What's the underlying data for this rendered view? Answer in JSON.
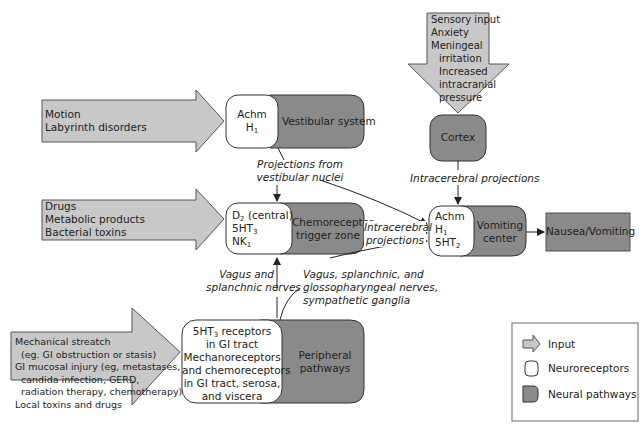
{
  "diagram": {
    "type": "flowchart"
  },
  "inputs": {
    "motion": {
      "line1": "Motion",
      "line2": "Labyrinth disorders"
    },
    "drugs": {
      "line1": "Drugs",
      "line2": "Metabolic products",
      "line3": "Bacterial toxins"
    },
    "sensory": {
      "line1": "Sensory input",
      "line2": "Anxiety",
      "line3": "Meningeal",
      "line4": "irritation",
      "line5": "Increased",
      "line6": "intracranial",
      "line7": "pressure"
    },
    "gi": {
      "line1": "Mechanical streatch",
      "line2": "(eg. GI obstruction or stasis)",
      "line3": "GI mucosal injury (eg, metastases,",
      "line4": "candida infection, GERD,",
      "line5": "radiation therapy, chemotherapy)",
      "line6": "Local toxins and drugs"
    }
  },
  "nodes": {
    "vestibular": {
      "receptors_line1": "Achm",
      "receptors_line2": "H",
      "receptors_line2_sub": "1",
      "label": "Vestibular system"
    },
    "ctz": {
      "r1": "D",
      "r1_sub": "2",
      "r1_suffix": " (central)",
      "r2": "5HT",
      "r2_sub": "3",
      "r3": "NK",
      "r3_sub": "1",
      "label_line1": "Chemoreceptor",
      "label_line2": "trigger zone"
    },
    "cortex": {
      "label": "Cortex"
    },
    "vomiting": {
      "r1": "Achm",
      "r2": "H",
      "r2_sub": "1",
      "r3": "5HT",
      "r3_sub": "2",
      "label_line1": "Vomiting",
      "label_line2": "center"
    },
    "peripheral": {
      "r1": "5HT",
      "r1_sub": "3",
      "r1_suffix": " receptors",
      "r2": "in GI tract",
      "r3": "Mechanoreceptors",
      "r4": "and chemoreceptors",
      "r5": "in GI tract, serosa,",
      "r6": "and viscera",
      "label_line1": "Peripheral",
      "label_line2": "pathways"
    },
    "outcome": {
      "label": "Nausea/Vomiting"
    }
  },
  "edge_labels": {
    "vestibular_nuclei_1": "Projections from",
    "vestibular_nuclei_2": "vestibular nuclei",
    "cortex_proj": "Intracerebral projections",
    "ctz_proj_1": "Intracerebral",
    "ctz_proj_2": "projections",
    "vagus_1": "Vagus and",
    "vagus_2": "splanchnic nerves",
    "vagus_gloss_1": "Vagus, splanchnic, and",
    "vagus_gloss_2": "glossopharyngeal nerves,",
    "vagus_gloss_3": "sympathetic ganglia"
  },
  "legend": {
    "items": [
      {
        "label": "Input",
        "icon": "arrow-input-icon"
      },
      {
        "label": "Neuroreceptors",
        "icon": "rounded-box-icon"
      },
      {
        "label": "Neural pathways",
        "icon": "pathway-box-icon"
      }
    ]
  },
  "colors": {
    "input_fill": "#c8c8c8",
    "pathway_fill": "#8a8a8a",
    "receptor_fill": "#ffffff",
    "stroke": "#333333"
  }
}
